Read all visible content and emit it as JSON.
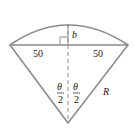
{
  "diagram": {
    "type": "circular-sector-geometry",
    "labels": {
      "left_half_chord": "50",
      "right_half_chord": "50",
      "sagitta": "b",
      "radius": "R",
      "half_angle_left_num": "θ",
      "half_angle_left_den": "2",
      "half_angle_right_num": "θ",
      "half_angle_right_den": "2"
    },
    "colors": {
      "stroke": "#8a8a8a",
      "text": "#222222",
      "background": "#ffffff"
    }
  }
}
